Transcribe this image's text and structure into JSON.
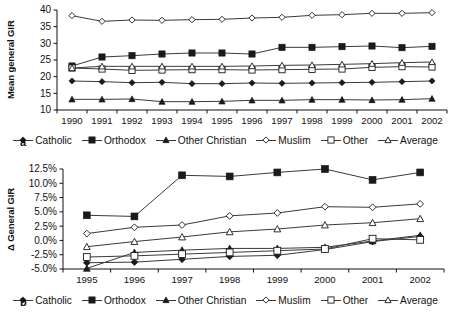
{
  "figure": {
    "panels": [
      {
        "tag": "a",
        "axis_label_y": "Mean general GIR",
        "legend": [
          {
            "label": "Catholic",
            "marker": "filled-diamond"
          },
          {
            "label": "Orthodox",
            "marker": "filled-square"
          },
          {
            "label": "Other Christian",
            "marker": "filled-triangle"
          },
          {
            "label": "Muslim",
            "marker": "open-diamond"
          },
          {
            "label": "Other",
            "marker": "open-square"
          },
          {
            "label": "Average",
            "marker": "open-triangle"
          }
        ]
      },
      {
        "tag": "b",
        "axis_label_y": "Δ General GIR",
        "legend": [
          {
            "label": "Catholic",
            "marker": "filled-diamond"
          },
          {
            "label": "Orthodox",
            "marker": "filled-square"
          },
          {
            "label": "Other Christian",
            "marker": "filled-triangle"
          },
          {
            "label": "Muslim",
            "marker": "open-diamond"
          },
          {
            "label": "Other",
            "marker": "open-square"
          },
          {
            "label": "Average",
            "marker": "open-triangle"
          }
        ]
      }
    ]
  },
  "chart_data": [
    {
      "type": "line",
      "panel": "a",
      "title": "",
      "xlabel": "",
      "ylabel": "Mean general GIR",
      "categories": [
        "1990",
        "1991",
        "1992",
        "1993",
        "1994",
        "1995",
        "1996",
        "1997",
        "1998",
        "1999",
        "2000",
        "2001",
        "2002"
      ],
      "yticks": [
        10,
        15,
        20,
        25,
        30,
        35,
        40
      ],
      "ytick_labels": [
        "10",
        "15",
        "20",
        "25",
        "30",
        "35",
        "40"
      ],
      "ylim": [
        10,
        40
      ],
      "grid": false,
      "legend_position": "bottom",
      "series": [
        {
          "name": "Catholic",
          "marker": "filled-diamond",
          "values": [
            18.7,
            18.5,
            18.2,
            18.3,
            17.9,
            17.9,
            18.1,
            18.0,
            18.1,
            18.2,
            18.3,
            18.5,
            18.7
          ]
        },
        {
          "name": "Orthodox",
          "marker": "filled-square",
          "values": [
            23.2,
            25.9,
            26.3,
            26.8,
            27.1,
            27.1,
            26.8,
            28.8,
            28.8,
            29.0,
            29.2,
            28.7,
            29.1
          ]
        },
        {
          "name": "Other Christian",
          "marker": "filled-triangle",
          "values": [
            13.2,
            13.2,
            13.3,
            12.5,
            12.5,
            12.6,
            12.9,
            12.9,
            13.1,
            13.1,
            13.0,
            13.1,
            13.4
          ]
        },
        {
          "name": "Muslim",
          "marker": "open-diamond",
          "values": [
            38.3,
            36.6,
            37.0,
            36.9,
            37.1,
            37.2,
            37.6,
            37.8,
            38.4,
            38.6,
            39.0,
            39.0,
            39.2
          ]
        },
        {
          "name": "Other",
          "marker": "open-square",
          "values": [
            22.6,
            22.3,
            21.9,
            22.0,
            22.1,
            22.1,
            22.0,
            22.1,
            22.2,
            22.3,
            22.8,
            23.0,
            22.9
          ]
        },
        {
          "name": "Average",
          "marker": "open-triangle",
          "values": [
            22.6,
            23.1,
            23.1,
            23.1,
            23.1,
            23.1,
            23.2,
            23.4,
            23.5,
            23.7,
            23.9,
            24.2,
            24.4
          ]
        }
      ]
    },
    {
      "type": "line",
      "panel": "b",
      "title": "",
      "xlabel": "",
      "ylabel": "Δ General GIR",
      "categories": [
        "1995",
        "1996",
        "1997",
        "1998",
        "1999",
        "2000",
        "2001",
        "2002"
      ],
      "yticks": [
        -5.0,
        -2.5,
        0.0,
        2.5,
        5.0,
        7.5,
        10.0,
        12.5
      ],
      "ytick_labels": [
        "-5.0%",
        "-2.5%",
        "0.0%",
        "2.5%",
        "5.0%",
        "7.5%",
        "10.0%",
        "12.5%"
      ],
      "ylim": [
        -5.0,
        12.5
      ],
      "unit": "%",
      "grid": false,
      "legend_position": "bottom",
      "series": [
        {
          "name": "Catholic",
          "marker": "filled-diamond",
          "values": [
            -3.9,
            -3.8,
            -3.3,
            -2.8,
            -2.6,
            -1.6,
            -0.2,
            0.7
          ]
        },
        {
          "name": "Orthodox",
          "marker": "filled-square",
          "values": [
            4.4,
            4.2,
            11.4,
            11.2,
            11.9,
            12.5,
            10.6,
            11.9
          ]
        },
        {
          "name": "Other Christian",
          "marker": "filled-triangle",
          "values": [
            -4.9,
            -2.1,
            -1.7,
            -1.4,
            -1.4,
            -1.2,
            -0.1,
            0.9
          ]
        },
        {
          "name": "Muslim",
          "marker": "open-diamond",
          "values": [
            1.2,
            2.3,
            2.7,
            4.3,
            4.8,
            5.9,
            5.8,
            6.4
          ]
        },
        {
          "name": "Other",
          "marker": "open-square",
          "values": [
            -2.9,
            -2.7,
            -2.4,
            -2.1,
            -1.8,
            -1.5,
            0.3,
            0.1
          ]
        },
        {
          "name": "Average",
          "marker": "open-triangle",
          "values": [
            -1.1,
            -0.2,
            0.6,
            1.5,
            2.0,
            2.7,
            3.1,
            3.8
          ]
        }
      ]
    }
  ]
}
